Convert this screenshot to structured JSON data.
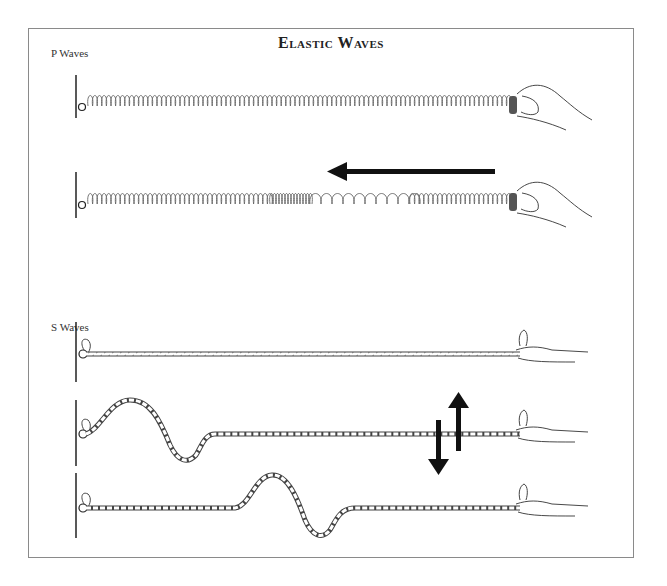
{
  "figure": {
    "title": "Elastic Waves",
    "sections": [
      {
        "label": "P Waves",
        "panels": [
          "spring-at-rest",
          "spring-compression-pulse"
        ],
        "arrow": "left"
      },
      {
        "label": "S Waves",
        "panels": [
          "rope-at-rest",
          "rope-wave-near-wall",
          "rope-wave-mid"
        ],
        "arrow": "up-down"
      }
    ]
  },
  "colors": {
    "frame": "#8a8a8a",
    "ink": "#222222",
    "spring": "#666666",
    "arrow": "#111111"
  }
}
